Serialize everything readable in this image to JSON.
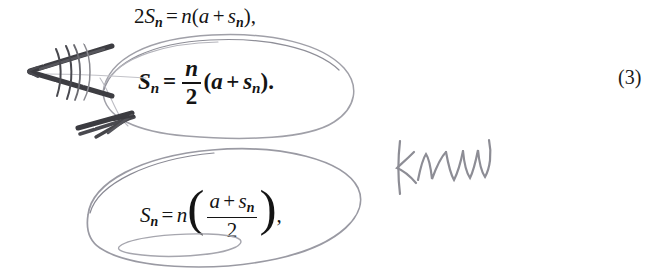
{
  "page": {
    "kind": "scanned-textbook-page-excerpt",
    "background_color": "#ffffff",
    "width": 667,
    "height": 275
  },
  "equations": [
    {
      "id": "eq-1",
      "plain_text": "2S_n = n(a + s_n),",
      "style": "italic-serif",
      "parts": {
        "coefficient": "2",
        "lhs_var": "S",
        "lhs_sub": "n",
        "equals": "=",
        "rhs_factor": "n",
        "open_paren": "(",
        "term_a": "a",
        "plus": "+",
        "term_s": "s",
        "term_s_sub": "n",
        "close_paren": ")",
        "trailing_punct": ","
      }
    },
    {
      "id": "eq-2",
      "plain_text": "S_n = (n/2)(a + s_n).",
      "style": "bold-italic-serif",
      "parts": {
        "lhs_var": "S",
        "lhs_sub": "n",
        "equals": "=",
        "frac_numerator": "n",
        "frac_denominator": "2",
        "open_paren": "(",
        "term_a": "a",
        "plus": "+",
        "term_s": "s",
        "term_s_sub": "n",
        "close_paren": ")",
        "trailing_punct": "."
      }
    },
    {
      "id": "eq-3",
      "plain_text": "S_n = n((a + s_n)/2),",
      "style": "italic-serif",
      "parts": {
        "lhs_var": "S",
        "lhs_sub": "n",
        "equals": "=",
        "rhs_factor": "n",
        "open_paren": "(",
        "frac_numerator_a": "a",
        "frac_plus": "+",
        "frac_numerator_s": "s",
        "frac_numerator_s_sub": "n",
        "frac_denominator": "2",
        "close_paren": ")",
        "trailing_punct": ","
      }
    }
  ],
  "equation_number": {
    "label": "(3)"
  },
  "annotations": {
    "handwriting_note": {
      "text": "know",
      "color": "#8b8b93",
      "description": "cursive pencil word written to the right of the lower circled equation"
    },
    "ink": {
      "pencil_light_color": "#9a9aa2",
      "pencil_dark_color": "#3a3a3e",
      "ellipse_upper_label": "circle around equation 2",
      "ellipse_lower_label": "circle around equation 3",
      "arrow_label": "double-stroke arrow pointing left",
      "arrowhead_lower_label": "second arrowhead pointing left"
    }
  }
}
